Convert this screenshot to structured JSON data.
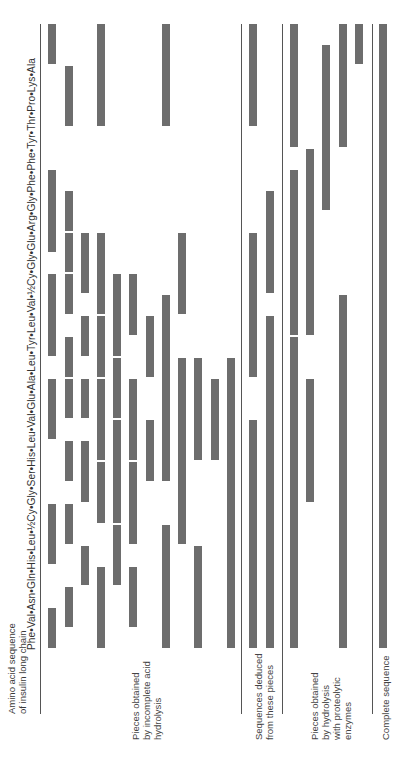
{
  "header": {
    "label_line1": "Amino acid sequence",
    "label_line2": "of insulin long chain",
    "sequence_text": "Phe•Val•Asn•Gln•His•Leu•½Cy•Gly•Ser•His•Leu•Val•Glu•Ala•Leu•Tyr•Leu•Val•½Cy•Gly•Glu•Arg•Gly•Phe•Phe•Tyr•Thr•Pro•Lys•Ala",
    "residues": [
      "Phe",
      "Val",
      "Asn",
      "Gln",
      "His",
      "Leu",
      "½Cy",
      "Gly",
      "Ser",
      "His",
      "Leu",
      "Val",
      "Glu",
      "Ala",
      "Leu",
      "Tyr",
      "Leu",
      "Val",
      "½Cy",
      "Gly",
      "Glu",
      "Arg",
      "Gly",
      "Phe",
      "Phe",
      "Tyr",
      "Thr",
      "Pro",
      "Lys",
      "Ala"
    ]
  },
  "sections": [
    {
      "id": "acid",
      "label_lines": [
        "Pieces obtained",
        "by incomplete acid",
        "hydrolysis"
      ]
    },
    {
      "id": "deduced",
      "label_lines": [
        "Sequences deduced",
        "from these pieces"
      ]
    },
    {
      "id": "enzymes",
      "label_lines": [
        "Pieces obtained",
        "by hydrolysis",
        "with proteolytic",
        "enzymes"
      ]
    },
    {
      "id": "complete",
      "label_lines": [
        "Complete sequence"
      ]
    }
  ],
  "colors": {
    "bar": "#6d6d6d",
    "line": "#555555",
    "text": "#3a3a3a"
  },
  "layout": {
    "residue_count": 30,
    "y_start": 650,
    "residue_px": 20.87
  },
  "pieces": {
    "acid": [
      {
        "x": 48,
        "from": 29,
        "to": 30
      },
      {
        "x": 48,
        "from": 20,
        "to": 23
      },
      {
        "x": 48,
        "from": 15,
        "to": 18
      },
      {
        "x": 48,
        "from": 11,
        "to": 13
      },
      {
        "x": 48,
        "from": 5,
        "to": 7
      },
      {
        "x": 48,
        "from": 1,
        "to": 2
      },
      {
        "x": 65,
        "from": 26,
        "to": 28
      },
      {
        "x": 65,
        "from": 21,
        "to": 22
      },
      {
        "x": 65,
        "from": 19,
        "to": 20
      },
      {
        "x": 65,
        "from": 17,
        "to": 18
      },
      {
        "x": 65,
        "from": 14,
        "to": 15
      },
      {
        "x": 65,
        "from": 12,
        "to": 13
      },
      {
        "x": 65,
        "from": 9,
        "to": 10
      },
      {
        "x": 65,
        "from": 6,
        "to": 7
      },
      {
        "x": 65,
        "from": 2,
        "to": 3
      },
      {
        "x": 81,
        "from": 18,
        "to": 20
      },
      {
        "x": 81,
        "from": 15,
        "to": 16
      },
      {
        "x": 81,
        "from": 12,
        "to": 13
      },
      {
        "x": 81,
        "from": 8,
        "to": 10
      },
      {
        "x": 81,
        "from": 4,
        "to": 5
      },
      {
        "x": 97,
        "from": 26,
        "to": 30
      },
      {
        "x": 97,
        "from": 17,
        "to": 20
      },
      {
        "x": 97,
        "from": 14,
        "to": 16
      },
      {
        "x": 97,
        "from": 10,
        "to": 13
      },
      {
        "x": 97,
        "from": 7,
        "to": 9
      },
      {
        "x": 97,
        "from": 1,
        "to": 4
      },
      {
        "x": 113,
        "from": 15,
        "to": 18
      },
      {
        "x": 113,
        "from": 12,
        "to": 14
      },
      {
        "x": 113,
        "from": 7,
        "to": 11
      },
      {
        "x": 113,
        "from": 4,
        "to": 6
      },
      {
        "x": 129,
        "from": 16,
        "to": 18
      },
      {
        "x": 129,
        "from": 10,
        "to": 13
      },
      {
        "x": 129,
        "from": 6,
        "to": 9
      },
      {
        "x": 129,
        "from": 2,
        "to": 4
      },
      {
        "x": 146,
        "from": 14,
        "to": 16
      },
      {
        "x": 146,
        "from": 9,
        "to": 11
      },
      {
        "x": 162,
        "from": 26,
        "to": 30
      },
      {
        "x": 162,
        "from": 13,
        "to": 17
      },
      {
        "x": 162,
        "from": 9,
        "to": 14
      },
      {
        "x": 162,
        "from": 1,
        "to": 6
      },
      {
        "x": 178,
        "from": 17,
        "to": 20
      },
      {
        "x": 178,
        "from": 10,
        "to": 14
      },
      {
        "x": 178,
        "from": 6,
        "to": 11
      },
      {
        "x": 194,
        "from": 10,
        "to": 14
      },
      {
        "x": 194,
        "from": 1,
        "to": 5
      },
      {
        "x": 211,
        "from": 10,
        "to": 13
      },
      {
        "x": 227,
        "from": 1,
        "to": 14
      }
    ],
    "deduced": [
      {
        "x": 249,
        "from": 26,
        "to": 30
      },
      {
        "x": 249,
        "from": 14,
        "to": 20
      },
      {
        "x": 249,
        "from": 1,
        "to": 11
      },
      {
        "x": 266,
        "from": 18,
        "to": 22
      },
      {
        "x": 266,
        "from": 1,
        "to": 13
      },
      {
        "x": 266,
        "from": 12,
        "to": 16
      }
    ],
    "enzymes": [
      {
        "x": 290,
        "from": 25,
        "to": 30
      },
      {
        "x": 290,
        "from": 16,
        "to": 23
      },
      {
        "x": 290,
        "from": 1,
        "to": 15
      },
      {
        "x": 306,
        "from": 16,
        "to": 24
      },
      {
        "x": 306,
        "from": 8,
        "to": 13
      },
      {
        "x": 322,
        "from": 22,
        "to": 29
      },
      {
        "x": 339,
        "from": 25,
        "to": 30
      },
      {
        "x": 339,
        "from": 1,
        "to": 17
      },
      {
        "x": 355,
        "from": 29,
        "to": 30
      }
    ],
    "complete": [
      {
        "x": 379,
        "from": 1,
        "to": 30
      }
    ]
  }
}
